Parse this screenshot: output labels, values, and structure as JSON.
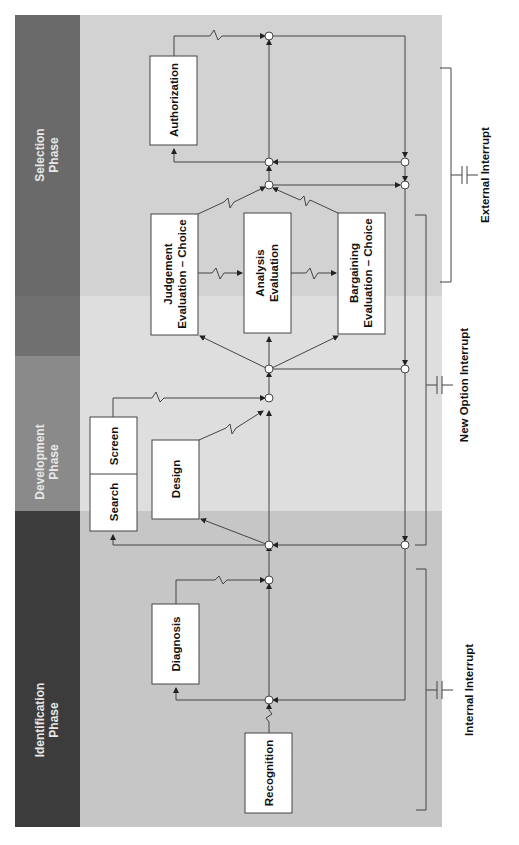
{
  "diagram": {
    "orientation": "rotated-90-ccw",
    "phases": [
      {
        "id": "identification",
        "line1": "Identification",
        "line2": "Phase",
        "band_color": "#3c3c3c",
        "area_color": "#c6c6c6"
      },
      {
        "id": "development",
        "line1": "Development",
        "line2": "Phase",
        "band_color": "#8a8a8a",
        "area_color": "#dedede"
      },
      {
        "id": "selection",
        "line1": "Selection",
        "line2": "Phase",
        "band_color": "#6a6a6a",
        "area_color": "#d2d2d2"
      }
    ],
    "boxes": {
      "recognition": "Recognition",
      "diagnosis": "Diagnosis",
      "search": "Search",
      "screen": "Screen",
      "design": "Design",
      "judgement_1": "Judgement",
      "judgement_2": "Evaluation – Choice",
      "analysis_1": "Analysis",
      "analysis_2": "Evaluation",
      "bargaining_1": "Bargaining",
      "bargaining_2": "Evaluation – Choice",
      "authorization": "Authorization"
    },
    "interrupts": {
      "internal": "Internal Interrupt",
      "new_option": "New Option Interrupt",
      "external": "External Interrupt"
    }
  }
}
